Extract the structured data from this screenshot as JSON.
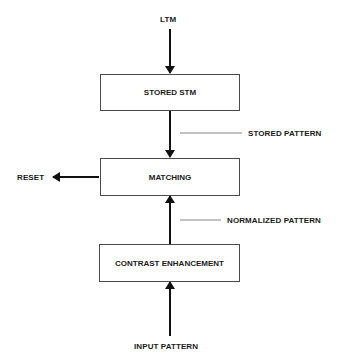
{
  "diagram": {
    "inputs": {
      "top": "LTM",
      "bottom": "INPUT PATTERN"
    },
    "boxes": [
      {
        "id": "stored-stm",
        "label": "STORED STM"
      },
      {
        "id": "matching",
        "label": "MATCHING"
      },
      {
        "id": "contrast-enhancement",
        "label": "CONTRAST ENHANCEMENT"
      }
    ],
    "annotations": {
      "stored_pattern": "STORED PATTERN",
      "normalized_pattern": "NORMALIZED PATTERN"
    },
    "output": {
      "reset": "RESET"
    },
    "edges": [
      {
        "from": "LTM",
        "to": "STORED STM"
      },
      {
        "from": "STORED STM",
        "to": "MATCHING",
        "label": "STORED PATTERN"
      },
      {
        "from": "CONTRAST ENHANCEMENT",
        "to": "MATCHING",
        "label": "NORMALIZED PATTERN"
      },
      {
        "from": "INPUT PATTERN",
        "to": "CONTRAST ENHANCEMENT"
      },
      {
        "from": "MATCHING",
        "to": "RESET"
      }
    ]
  }
}
